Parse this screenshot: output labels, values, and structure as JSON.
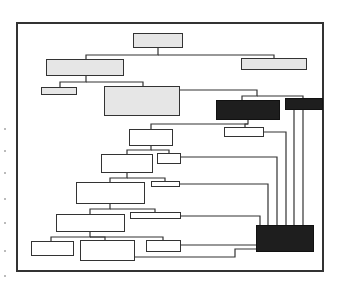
{
  "diagram": {
    "type": "organizational-tree",
    "style": {
      "line_color": "#333333",
      "light_fill": "#e6e6e6",
      "dark_fill": "#1e1e1e",
      "background": "#ffffff"
    },
    "nodes": [
      {
        "id": "root",
        "fill": "light",
        "x": 133,
        "y": 33,
        "w": 50,
        "h": 15
      },
      {
        "id": "l1-left",
        "fill": "light",
        "x": 46,
        "y": 59,
        "w": 78,
        "h": 17
      },
      {
        "id": "l1-right",
        "fill": "light",
        "x": 241,
        "y": 58,
        "w": 66,
        "h": 12
      },
      {
        "id": "l2-small",
        "fill": "light",
        "x": 41,
        "y": 87,
        "w": 36,
        "h": 8
      },
      {
        "id": "l2-big",
        "fill": "light",
        "x": 104,
        "y": 86,
        "w": 76,
        "h": 30
      },
      {
        "id": "dark-a",
        "fill": "dark",
        "x": 216,
        "y": 100,
        "w": 64,
        "h": 20
      },
      {
        "id": "dark-b",
        "fill": "dark",
        "x": 285,
        "y": 98,
        "w": 38,
        "h": 12
      },
      {
        "id": "n1",
        "fill": "white",
        "x": 129,
        "y": 129,
        "w": 44,
        "h": 17
      },
      {
        "id": "n1-side",
        "fill": "white",
        "x": 224,
        "y": 127,
        "w": 40,
        "h": 10
      },
      {
        "id": "n2",
        "fill": "white",
        "x": 101,
        "y": 154,
        "w": 52,
        "h": 19
      },
      {
        "id": "n2-side",
        "fill": "white",
        "x": 157,
        "y": 153,
        "w": 24,
        "h": 11
      },
      {
        "id": "n3",
        "fill": "white",
        "x": 76,
        "y": 182,
        "w": 69,
        "h": 22
      },
      {
        "id": "n3-side",
        "fill": "white",
        "x": 151,
        "y": 181,
        "w": 29,
        "h": 6
      },
      {
        "id": "n4",
        "fill": "white",
        "x": 56,
        "y": 214,
        "w": 69,
        "h": 18
      },
      {
        "id": "n4-side",
        "fill": "white",
        "x": 130,
        "y": 212,
        "w": 51,
        "h": 7
      },
      {
        "id": "n5-a",
        "fill": "white",
        "x": 31,
        "y": 241,
        "w": 43,
        "h": 15
      },
      {
        "id": "n5-b",
        "fill": "white",
        "x": 80,
        "y": 240,
        "w": 55,
        "h": 21
      },
      {
        "id": "n5-c",
        "fill": "white",
        "x": 146,
        "y": 240,
        "w": 35,
        "h": 12
      },
      {
        "id": "dark-c",
        "fill": "dark",
        "x": 256,
        "y": 225,
        "w": 58,
        "h": 27
      }
    ]
  }
}
